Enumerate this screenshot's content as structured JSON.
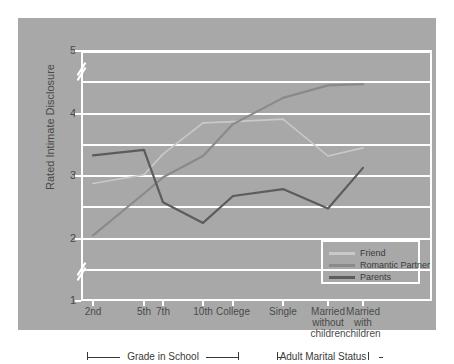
{
  "chart_data": {
    "type": "line",
    "title": "",
    "xlabel": "",
    "ylabel": "Rated Intimate Disclosure",
    "categories": [
      "2nd",
      "5th",
      "7th",
      "10th",
      "College",
      "Single",
      "Married without children",
      "Married with children"
    ],
    "category_lines": [
      [
        "2nd"
      ],
      [
        "5th"
      ],
      [
        "7th"
      ],
      [
        "10th"
      ],
      [
        "College"
      ],
      [
        "Single"
      ],
      [
        "Married",
        "without",
        "children"
      ],
      [
        "Married",
        "with",
        "children"
      ]
    ],
    "ylim": [
      1,
      5
    ],
    "yticks": [
      1,
      2,
      3,
      4,
      5
    ],
    "ytick_labels": [
      "1",
      "2",
      "3",
      "4",
      "5"
    ],
    "axis_breaks": [
      "between 1 and 2",
      "between 4 and 5"
    ],
    "grid": true,
    "grid_color": "#ffffff",
    "plot_background": "#a8a8a8",
    "legend_position": "inside-lower-right",
    "series": [
      {
        "name": "Friend",
        "color": "#c9c9c9",
        "values": [
          2.88,
          3.02,
          3.35,
          3.85,
          3.87,
          3.91,
          3.32,
          3.45
        ]
      },
      {
        "name": "Romantic Partner",
        "color": "#8a8a8a",
        "values": [
          2.05,
          2.72,
          2.98,
          3.32,
          3.83,
          4.25,
          4.45,
          4.47
        ]
      },
      {
        "name": "Parents",
        "color": "#5c5c5c",
        "values": [
          3.33,
          3.42,
          2.58,
          2.25,
          2.68,
          2.79,
          2.48,
          3.13
        ]
      }
    ]
  },
  "axis": {
    "y_title": "Rated Intimate Disclosure"
  },
  "brackets": [
    {
      "label": "Grade in School"
    },
    {
      "label": "Adult Marital Status"
    }
  ],
  "legend": {
    "items": [
      {
        "label": "Friend"
      },
      {
        "label": "Romantic Partner"
      },
      {
        "label": "Parents"
      }
    ]
  }
}
